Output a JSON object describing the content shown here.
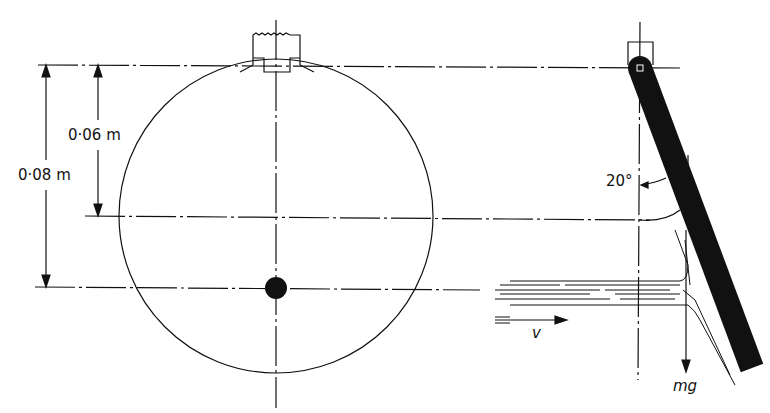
{
  "diagram": {
    "labels": {
      "dim_outer": "0·08 m",
      "dim_inner": "0·06 m",
      "angle": "20°",
      "velocity": "v",
      "weight": "mg"
    },
    "colors": {
      "ink": "#111111",
      "background": "#ffffff"
    },
    "elements": [
      "disc",
      "pivot-mount",
      "centre-of-mass-dot",
      "dimension-0.08m",
      "dimension-0.06m",
      "pivoted-bar",
      "water-jet",
      "velocity-arrow",
      "weight-arrow",
      "angle-20deg"
    ]
  }
}
